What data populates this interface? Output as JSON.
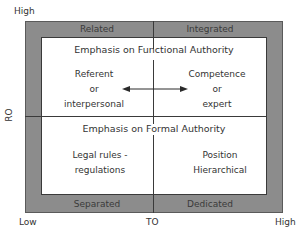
{
  "y_axis": {
    "label": "RO",
    "high": "High"
  },
  "x_axis": {
    "label": "TO",
    "low": "Low",
    "high": "High"
  },
  "top_band": {
    "left": "Related",
    "right": "Integrated"
  },
  "bottom_band": {
    "left": "Separated",
    "right": "Dedicated"
  },
  "upper_section": {
    "heading": "Emphasis on Functional Authority",
    "left": [
      "Referent",
      "or",
      "interpersonal"
    ],
    "right": [
      "Competence",
      "or",
      "expert"
    ],
    "arrow": "double-headed-arrow"
  },
  "lower_section": {
    "heading": "Emphasis on Formal Authority",
    "left": [
      "Legal rules -",
      "regulations"
    ],
    "right": [
      "Position",
      "Hierarchical"
    ]
  },
  "colors": {
    "band": "#8c8c8c",
    "inner": "#ffffff",
    "line": "#3a3a3a"
  }
}
